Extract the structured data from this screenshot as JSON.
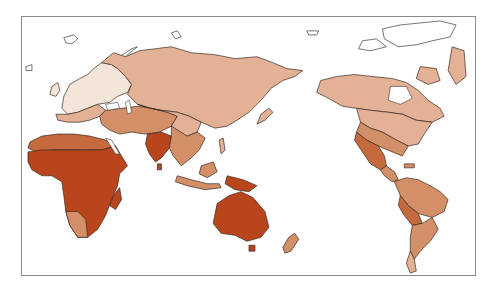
{
  "map": {
    "type": "choropleth-world-map",
    "projection": "pacific-centered",
    "legend": null,
    "title": null,
    "colors": {
      "level_0_none": "#ffffff",
      "level_1_lightest": "#f3e6d8",
      "level_2_light": "#e3b196",
      "level_3_medium": "#d38f67",
      "level_4_dark": "#c46a3d",
      "level_5_darkest": "#b8451c",
      "border": "#3a2a22",
      "frame": "#8a8a8a"
    },
    "regions": [
      {
        "name": "greenland-arctic",
        "level": "level_0_none"
      },
      {
        "name": "northern-europe",
        "level": "level_1_lightest"
      },
      {
        "name": "russia-north-asia",
        "level": "level_2_light"
      },
      {
        "name": "canada-usa",
        "level": "level_2_light"
      },
      {
        "name": "middle-east",
        "level": "level_3_medium"
      },
      {
        "name": "southeast-asia",
        "level": "level_3_medium"
      },
      {
        "name": "mexico",
        "level": "level_4_dark"
      },
      {
        "name": "south-america",
        "level": "level_3_medium"
      },
      {
        "name": "india",
        "level": "level_5_darkest"
      },
      {
        "name": "africa",
        "level": "level_5_darkest"
      },
      {
        "name": "australia",
        "level": "level_5_darkest"
      },
      {
        "name": "new-zealand",
        "level": "level_3_medium"
      }
    ]
  }
}
